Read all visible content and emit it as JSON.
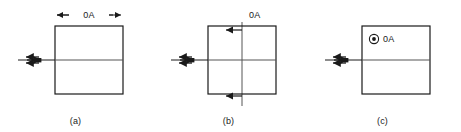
{
  "figure": {
    "title": "",
    "panel_count": 3,
    "stroke_color": "#1a1a1a",
    "text_color": "#1a1a1a",
    "background": "#ffffff"
  },
  "panels": [
    {
      "id": "a",
      "caption": "(a)",
      "label": "0A",
      "annotation_type": "horizontal-dimension-arrow",
      "square": {
        "x": 55,
        "y": 26,
        "size": 68
      },
      "midline": true,
      "left_cluster": {
        "type": "cross-arrow-cluster",
        "has_center_dot": true,
        "up_arrow": true,
        "down_arrow": true,
        "right_arrow": true
      }
    },
    {
      "id": "b",
      "caption": "(b)",
      "label": "0A",
      "annotation_type": "vertical-double-arrow",
      "square": {
        "x": 55,
        "y": 26,
        "size": 68
      },
      "midline": true,
      "left_cluster": {
        "type": "cross-arrow-cluster",
        "has_center_dot": true,
        "up_arrow": true,
        "down_arrow": true,
        "right_arrow": true
      }
    },
    {
      "id": "c",
      "caption": "(c)",
      "label": "0A",
      "annotation_type": "circled-dot-out-of-page",
      "square": {
        "x": 55,
        "y": 26,
        "size": 68
      },
      "midline": true,
      "left_cluster": {
        "type": "cross-arrow-cluster",
        "has_center_dot": true,
        "up_arrow": true,
        "down_arrow": true,
        "right_arrow": true
      }
    }
  ]
}
